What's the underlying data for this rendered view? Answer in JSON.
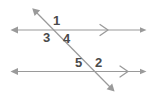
{
  "figure": {
    "background_color": "#ffffff",
    "line_color": "#9a9a9a",
    "label_color": "#4a4a4a",
    "stroke_width": 1.2
  },
  "lines": {
    "upper_parallel": {
      "name": "upper parallel line",
      "x1": 11,
      "y1": 30,
      "x2": 146,
      "y2": 30,
      "arrow_left": true,
      "arrow_right": true,
      "chevron_x": 104,
      "chevron_count": 1
    },
    "lower_parallel": {
      "name": "lower parallel line",
      "x1": 11,
      "y1": 71.5,
      "x2": 146,
      "y2": 71.5,
      "arrow_left": true,
      "arrow_right": true,
      "chevron_x": 124,
      "chevron_count": 1
    },
    "transversal": {
      "name": "transversal line",
      "x1": 33,
      "y1": 9,
      "x2": 114,
      "y2": 91,
      "arrow_start": true,
      "arrow_end": true
    }
  },
  "intersections": {
    "upper": {
      "x": 58,
      "y": 30
    },
    "lower": {
      "x": 87,
      "y": 71.5
    }
  },
  "angle_labels": [
    {
      "id": "angle-1",
      "text": "1",
      "x": 53,
      "y": 14,
      "position": "upper-intersection-above-right"
    },
    {
      "id": "angle-3",
      "text": "3",
      "x": 43,
      "y": 31,
      "position": "upper-intersection-below-left"
    },
    {
      "id": "angle-4",
      "text": "4",
      "x": 63,
      "y": 32,
      "position": "upper-intersection-below-right"
    },
    {
      "id": "angle-5",
      "text": "5",
      "x": 75,
      "y": 56,
      "position": "lower-intersection-above-left"
    },
    {
      "id": "angle-2",
      "text": "2",
      "x": 95,
      "y": 56,
      "position": "lower-intersection-above-right"
    }
  ]
}
